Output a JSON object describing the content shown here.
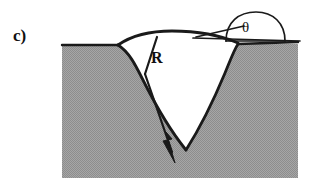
{
  "figure": {
    "panel_label": "c)",
    "radius_label": "R",
    "contact_angle_label": "θ",
    "caption_alt": "Cross-section of a V-shaped groove in a solid substrate with a curved liquid meniscus spanning the groove mouth; R denotes the meniscus radius of curvature and theta the contact angle shown in the inset droplet at upper right.",
    "colors": {
      "substrate_fill": "#9a9a9a",
      "stroke": "#1a1a1a",
      "background": "#ffffff",
      "text": "#111111"
    },
    "geometry": {
      "substrate_left": 62,
      "substrate_right": 298,
      "substrate_top": 45,
      "substrate_bottom": 178,
      "groove_tip_x": 186,
      "groove_tip_y": 150,
      "meniscus_left_x": 118,
      "meniscus_left_y": 45,
      "meniscus_right_x": 238,
      "meniscus_right_y": 43,
      "meniscus_apex_y": 31,
      "radius_line_start_x": 157,
      "radius_line_start_y": 37,
      "arrow_tip_x": 175,
      "arrow_tip_y": 163,
      "droplet_left_x": 226,
      "droplet_right_x": 286,
      "droplet_apex_y": 12,
      "droplet_base_y": 41
    }
  }
}
